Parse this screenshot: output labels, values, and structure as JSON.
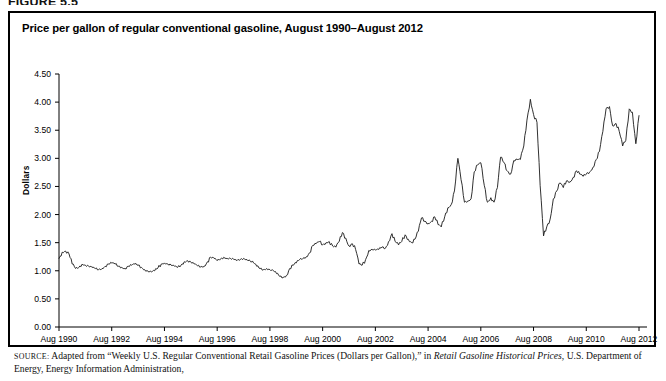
{
  "figure": {
    "number": "FIGURE 5.5",
    "title": "Price per gallon of regular conventional gasoline, August 1990–August 2012",
    "source_label": "SOURCE:",
    "source_text_1": " Adapted from “Weekly U.S. Regular Conventional Retail Gasoline Prices (Dollars per Gallon),” in ",
    "source_italic": "Retail Gasoline Historical Prices",
    "source_text_2": ", U.S. Department of Energy, Energy Information Administration,"
  },
  "chart_data": {
    "type": "line",
    "title": "Price per gallon of regular conventional gasoline, August 1990–August 2012",
    "xlabel": "",
    "ylabel": "Dollars",
    "ylim": [
      0.0,
      4.5
    ],
    "ytick_labels": [
      "0.00",
      "0.50",
      "1.00",
      "1.50",
      "2.00",
      "2.50",
      "3.00",
      "3.50",
      "4.00",
      "4.50"
    ],
    "ytick_values": [
      0.0,
      0.5,
      1.0,
      1.5,
      2.0,
      2.5,
      3.0,
      3.5,
      4.0,
      4.5
    ],
    "xtick_labels": [
      "Aug 1990",
      "Aug 1992",
      "Aug 1994",
      "Aug 1996",
      "Aug 1998",
      "Aug 2000",
      "Aug 2002",
      "Aug 2004",
      "Aug 2006",
      "Aug 2008",
      "Aug 2010",
      "Aug 2012"
    ],
    "xtick_values": [
      1990.58,
      1992.58,
      1994.58,
      1996.58,
      1998.58,
      2000.58,
      2002.58,
      2004.58,
      2006.58,
      2008.58,
      2010.58,
      2012.58
    ],
    "xlim": [
      1990.58,
      2012.58
    ],
    "grid": false,
    "legend": "none",
    "line_color": "#1a1a1a",
    "series": [
      {
        "name": "Regular conventional gasoline (dollars per gallon)",
        "x": [
          1990.58,
          1990.7,
          1990.83,
          1990.96,
          1991.08,
          1991.21,
          1991.33,
          1991.46,
          1991.58,
          1991.71,
          1991.83,
          1991.96,
          1992.08,
          1992.21,
          1992.33,
          1992.46,
          1992.58,
          1992.71,
          1992.83,
          1992.96,
          1993.08,
          1993.21,
          1993.33,
          1993.46,
          1993.58,
          1993.71,
          1993.83,
          1993.96,
          1994.08,
          1994.21,
          1994.33,
          1994.46,
          1994.58,
          1994.71,
          1994.83,
          1994.96,
          1995.08,
          1995.21,
          1995.33,
          1995.46,
          1995.58,
          1995.71,
          1995.83,
          1995.96,
          1996.08,
          1996.21,
          1996.33,
          1996.46,
          1996.58,
          1996.71,
          1996.83,
          1996.96,
          1997.08,
          1997.21,
          1997.33,
          1997.46,
          1997.58,
          1997.71,
          1997.83,
          1997.96,
          1998.08,
          1998.21,
          1998.33,
          1998.46,
          1998.58,
          1998.71,
          1998.83,
          1998.96,
          1999.08,
          1999.21,
          1999.33,
          1999.46,
          1999.58,
          1999.71,
          1999.83,
          1999.96,
          2000.08,
          2000.21,
          2000.33,
          2000.46,
          2000.58,
          2000.71,
          2000.83,
          2000.96,
          2001.08,
          2001.21,
          2001.33,
          2001.46,
          2001.58,
          2001.71,
          2001.83,
          2001.96,
          2002.08,
          2002.21,
          2002.33,
          2002.46,
          2002.58,
          2002.71,
          2002.83,
          2002.96,
          2003.08,
          2003.21,
          2003.33,
          2003.46,
          2003.58,
          2003.71,
          2003.83,
          2003.96,
          2004.08,
          2004.21,
          2004.33,
          2004.46,
          2004.58,
          2004.71,
          2004.83,
          2004.96,
          2005.08,
          2005.21,
          2005.33,
          2005.46,
          2005.58,
          2005.71,
          2005.83,
          2005.96,
          2006.08,
          2006.21,
          2006.33,
          2006.46,
          2006.58,
          2006.71,
          2006.83,
          2006.96,
          2007.08,
          2007.21,
          2007.33,
          2007.46,
          2007.58,
          2007.71,
          2007.83,
          2007.96,
          2008.08,
          2008.21,
          2008.33,
          2008.46,
          2008.58,
          2008.71,
          2008.83,
          2008.96,
          2009.08,
          2009.21,
          2009.33,
          2009.46,
          2009.58,
          2009.71,
          2009.83,
          2009.96,
          2010.08,
          2010.21,
          2010.33,
          2010.46,
          2010.58,
          2010.71,
          2010.83,
          2010.96,
          2011.08,
          2011.21,
          2011.33,
          2011.46,
          2011.58,
          2011.71,
          2011.83,
          2011.96,
          2012.08,
          2012.21,
          2012.33,
          2012.46,
          2012.58
        ],
        "y": [
          1.22,
          1.33,
          1.35,
          1.3,
          1.12,
          1.04,
          1.06,
          1.12,
          1.1,
          1.08,
          1.06,
          1.04,
          1.02,
          1.04,
          1.08,
          1.12,
          1.14,
          1.12,
          1.08,
          1.06,
          1.04,
          1.08,
          1.1,
          1.12,
          1.1,
          1.06,
          1.02,
          0.99,
          0.98,
          1.0,
          1.05,
          1.12,
          1.14,
          1.12,
          1.1,
          1.08,
          1.06,
          1.1,
          1.16,
          1.18,
          1.15,
          1.12,
          1.09,
          1.07,
          1.08,
          1.16,
          1.24,
          1.22,
          1.18,
          1.21,
          1.24,
          1.22,
          1.22,
          1.2,
          1.18,
          1.2,
          1.22,
          1.2,
          1.18,
          1.14,
          1.08,
          1.04,
          1.02,
          1.04,
          1.02,
          1.0,
          0.95,
          0.9,
          0.88,
          0.92,
          1.04,
          1.1,
          1.14,
          1.2,
          1.22,
          1.25,
          1.32,
          1.45,
          1.48,
          1.52,
          1.46,
          1.5,
          1.52,
          1.44,
          1.42,
          1.52,
          1.68,
          1.58,
          1.44,
          1.48,
          1.38,
          1.12,
          1.1,
          1.2,
          1.36,
          1.38,
          1.37,
          1.38,
          1.42,
          1.4,
          1.52,
          1.66,
          1.52,
          1.46,
          1.52,
          1.64,
          1.56,
          1.5,
          1.56,
          1.7,
          1.94,
          1.88,
          1.84,
          1.88,
          1.96,
          1.82,
          1.78,
          1.96,
          2.12,
          2.18,
          2.42,
          3.0,
          2.62,
          2.22,
          2.24,
          2.28,
          2.76,
          2.88,
          2.92,
          2.52,
          2.22,
          2.3,
          2.22,
          2.48,
          3.02,
          2.92,
          2.78,
          2.72,
          2.96,
          2.98,
          2.98,
          3.22,
          3.68,
          4.05,
          3.78,
          3.64,
          2.52,
          1.62,
          1.78,
          1.92,
          2.28,
          2.42,
          2.56,
          2.48,
          2.6,
          2.58,
          2.66,
          2.78,
          2.72,
          2.68,
          2.72,
          2.76,
          2.84,
          2.98,
          3.12,
          3.48,
          3.88,
          3.92,
          3.58,
          3.62,
          3.48,
          3.22,
          3.32,
          3.88,
          3.82,
          3.26,
          3.76
        ]
      }
    ],
    "annotations": {
      "peak_2008": {
        "value": 4.05,
        "label": "mid-2008 peak"
      },
      "trough_2008": {
        "value": 1.62,
        "label": "late-2008 trough"
      },
      "min_1999": {
        "value": 0.88,
        "label": "early 1999 low"
      }
    }
  }
}
